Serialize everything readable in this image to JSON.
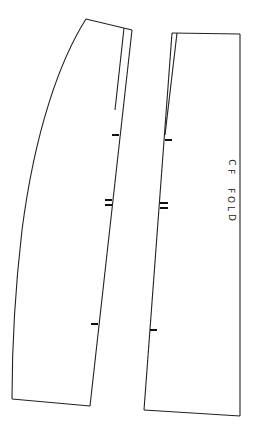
{
  "diagram": {
    "type": "sewing-pattern",
    "pieces": [
      {
        "name": "side-panel",
        "outline": [
          [
            86,
            19
          ],
          [
            132,
            30
          ],
          [
            90,
            406
          ],
          [
            12,
            399
          ]
        ],
        "curve_edge": "M86,19 C60,60 35,130 22,230 C15,290 12,350 12,399",
        "dart_line": [
          [
            124,
            28
          ],
          [
            115,
            110
          ]
        ],
        "notches": [
          {
            "type": "single",
            "y": 135,
            "x1": 112,
            "x2": 119
          },
          {
            "type": "double",
            "y": [
              200,
              205
            ],
            "x1": 105,
            "x2": 112
          },
          {
            "type": "single",
            "y": 324,
            "x1": 91,
            "x2": 98
          }
        ]
      },
      {
        "name": "center-front-panel",
        "outline": [
          [
            172,
            33
          ],
          [
            240,
            34
          ],
          [
            240,
            416
          ],
          [
            144,
            410
          ]
        ],
        "dart_line": [
          [
            177,
            33
          ],
          [
            165,
            135
          ]
        ],
        "notches": [
          {
            "type": "single",
            "y": 140,
            "x1": 165,
            "x2": 172
          },
          {
            "type": "double",
            "y": [
              203,
              208
            ],
            "x1": 160,
            "x2": 168
          },
          {
            "type": "single",
            "y": 330,
            "x1": 150,
            "x2": 157
          }
        ]
      }
    ],
    "label": {
      "line1": [
        "C",
        "F"
      ],
      "line2": [
        "F",
        "O",
        "L",
        "D"
      ],
      "text": "CF FOLD"
    },
    "colors": {
      "background": "#ffffff",
      "stroke": "#222222"
    }
  }
}
